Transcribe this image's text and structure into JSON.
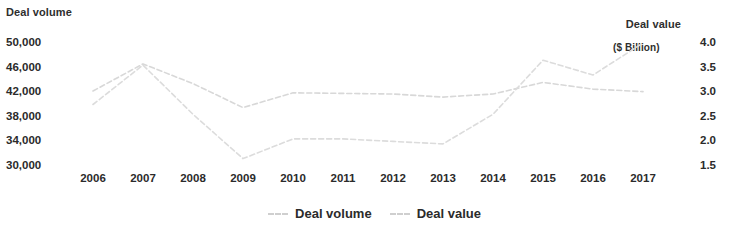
{
  "chart_data": {
    "type": "line",
    "title": "",
    "subtitle": "",
    "xlabel": "",
    "ylabel": "Deal volume",
    "y2label": "Deal value\n($ Billion)",
    "grid": false,
    "legend_position": "bottom-center",
    "x": [
      "2006",
      "2007",
      "2008",
      "2009",
      "2010",
      "2011",
      "2012",
      "2013",
      "2014",
      "2015",
      "2016",
      "2017"
    ],
    "categories": [
      "2006",
      "2007",
      "2008",
      "2009",
      "2010",
      "2011",
      "2012",
      "2013",
      "2014",
      "2015",
      "2016",
      "2017"
    ],
    "ylim": [
      30000,
      50000
    ],
    "y2lim": [
      1.5,
      4.0
    ],
    "yticks": [
      "50,000",
      "46,000",
      "42,000",
      "38,000",
      "34,000",
      "30,000"
    ],
    "ytick_values": [
      50000,
      46000,
      42000,
      38000,
      34000,
      30000
    ],
    "y2ticks": [
      "4.0",
      "3.5",
      "3.0",
      "2.5",
      "2.0",
      "1.5"
    ],
    "y2tick_values": [
      4.0,
      3.5,
      3.0,
      2.5,
      2.0,
      1.5
    ],
    "series": [
      {
        "name": "Deal volume",
        "axis": "left",
        "color": "#d8d8d8",
        "style": "dashed",
        "values": [
          42200,
          46600,
          43400,
          39500,
          41900,
          41800,
          41700,
          41200,
          41700,
          43600,
          42500,
          42100
        ]
      },
      {
        "name": "Deal value",
        "axis": "right",
        "color": "#dcdcdc",
        "style": "dashed",
        "values": [
          2.75,
          3.55,
          2.55,
          1.65,
          2.05,
          2.05,
          2.0,
          1.95,
          2.55,
          3.65,
          3.35,
          4.0
        ]
      }
    ],
    "legend": [
      {
        "label": "Deal volume",
        "color": "#cfcfcf"
      },
      {
        "label": "Deal value",
        "color": "#cfcfcf"
      }
    ]
  },
  "axes": {
    "left_title": "Deal volume",
    "right_title_main": "Deal value",
    "right_title_sub": "($ Billion)"
  }
}
